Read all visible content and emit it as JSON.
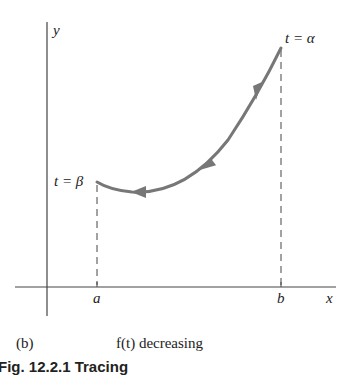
{
  "figure": {
    "axes": {
      "x_label": "x",
      "y_label": "y",
      "tick_a": "a",
      "tick_b": "b"
    },
    "curve": {
      "start_label": "t = α",
      "end_label": "t = β",
      "color": "#777777",
      "direction": "from t=α at x=b to t=β at x=a"
    },
    "panel_label": "(b)",
    "subcaption": "f(t) decreasing",
    "figure_caption": "Fig. 12.2.1   Tracing"
  }
}
